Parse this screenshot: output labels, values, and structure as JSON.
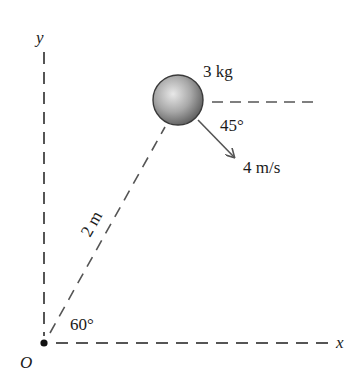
{
  "figure": {
    "axes": {
      "x_label": "x",
      "y_label": "y",
      "origin_label": "O"
    },
    "mass_label": "3 kg",
    "velocity_label": "4 m/s",
    "velocity_angle_label": "45°",
    "position_angle_label": "60°",
    "distance_label": "2 m",
    "colors": {
      "ink": "#1a1a1a",
      "dash": "#555555",
      "ball_light": "#e6e6e6",
      "ball_dark": "#6e6e6e",
      "arrow": "#555555"
    }
  }
}
